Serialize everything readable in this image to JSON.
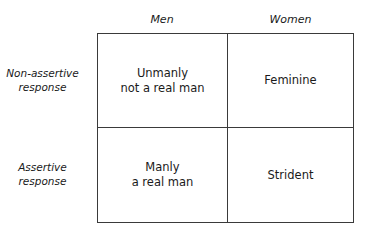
{
  "diagram": {
    "type": "2x2 matrix",
    "columns": [
      {
        "label": "Men"
      },
      {
        "label": "Women"
      }
    ],
    "rows": [
      {
        "label_line1": "Non-assertive",
        "label_line2": "response"
      },
      {
        "label_line1": "Assertive",
        "label_line2": "response"
      }
    ],
    "cells": {
      "r0c0": {
        "line1": "Unmanly",
        "line2": "not a real man"
      },
      "r0c1": {
        "line1": "Feminine"
      },
      "r1c0": {
        "line1": "Manly",
        "line2": "a real man"
      },
      "r1c1": {
        "line1": "Strident"
      }
    },
    "colors": {
      "line": "#3a3a3a",
      "text": "#1a1a1a",
      "background": "#ffffff"
    }
  }
}
